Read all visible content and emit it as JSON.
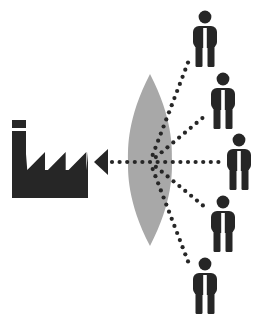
{
  "diagram": {
    "type": "conceptual-flow-diagram",
    "canvas": {
      "width": 260,
      "height": 322,
      "background": "#ffffff"
    },
    "colors": {
      "dark": "#262626",
      "lens_gray": "#a8a8a8",
      "background": "#ffffff"
    },
    "factory": {
      "label": "factory-icon",
      "x": 12,
      "y": 120,
      "width": 76,
      "height": 78,
      "chimney": {
        "x": 12,
        "y": 120,
        "width": 14,
        "height": 34
      },
      "roof_teeth": 3,
      "color": "#262626"
    },
    "lens": {
      "label": "lens-shape",
      "center_x": 150,
      "center_y": 162,
      "top_y": 74,
      "bottom_y": 246,
      "half_width": 22,
      "color": "#a8a8a8"
    },
    "arrow": {
      "label": "output-arrow",
      "direction": "left",
      "head_x": 94,
      "head_y": 162,
      "head_width": 14,
      "head_height": 13,
      "color": "#262626",
      "dot_radius": 2.1,
      "dot_spacing": 7.6
    },
    "rays": [
      {
        "name": "ray-to-person-1",
        "from_x": 150,
        "from_y": 162,
        "to_x": 189,
        "to_y": 60
      },
      {
        "name": "ray-to-person-2",
        "from_x": 150,
        "from_y": 162,
        "to_x": 206,
        "to_y": 115
      },
      {
        "name": "ray-to-person-3",
        "from_x": 150,
        "from_y": 162,
        "to_x": 222,
        "to_y": 162
      },
      {
        "name": "ray-to-person-4",
        "from_x": 150,
        "from_y": 162,
        "to_x": 206,
        "to_y": 208
      },
      {
        "name": "ray-to-person-5",
        "from_x": 150,
        "from_y": 162,
        "to_x": 189,
        "to_y": 264
      }
    ],
    "people": [
      {
        "name": "person-1",
        "x": 189,
        "y": 8,
        "scale": 1.0,
        "color": "#262626"
      },
      {
        "name": "person-2",
        "x": 207,
        "y": 70,
        "scale": 1.0,
        "color": "#262626"
      },
      {
        "name": "person-3",
        "x": 223,
        "y": 131,
        "scale": 1.0,
        "color": "#262626"
      },
      {
        "name": "person-4",
        "x": 207,
        "y": 193,
        "scale": 1.0,
        "color": "#262626"
      },
      {
        "name": "person-5",
        "x": 189,
        "y": 255,
        "scale": 1.0,
        "color": "#262626"
      }
    ],
    "person_glyph": {
      "head_cx": 16,
      "head_cy": 9,
      "head_r": 6.4,
      "body_x": 4,
      "body_y": 18,
      "body_w": 24,
      "body_h": 22,
      "body_radius": 6,
      "leg_left_x": 6.5,
      "leg_right_x": 18.5,
      "leg_y": 34,
      "leg_w": 7,
      "leg_h": 25,
      "gap_x": 14.2,
      "gap_w": 3.6,
      "gap_y": 20,
      "gap_h": 40
    }
  }
}
